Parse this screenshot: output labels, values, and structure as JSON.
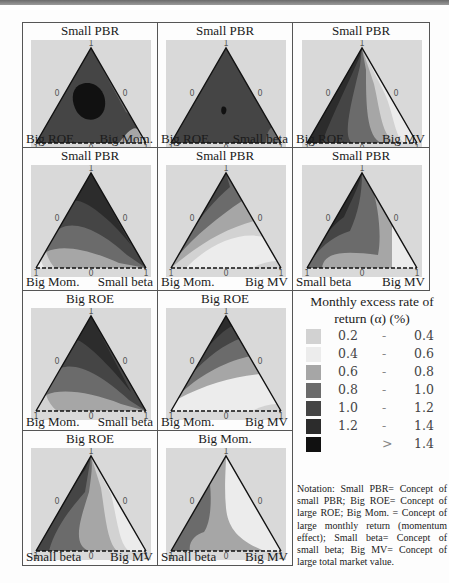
{
  "chart_data": {
    "type": "heatmap",
    "subtype": "ternary-contour",
    "title": "",
    "legend_title": "Monthly excess rate of return (α) (%)",
    "axis_tick_labels": {
      "vertex": "1",
      "edge_mid": "0",
      "corner": "1"
    },
    "bins": [
      {
        "range": "0.2 - 0.4",
        "color": "#d2d2d2"
      },
      {
        "range": "0.4 - 0.6",
        "color": "#ececec"
      },
      {
        "range": "0.6 - 0.8",
        "color": "#a6a6a6"
      },
      {
        "range": "0.8 - 1.0",
        "color": "#6b6b6b"
      },
      {
        "range": "1.0 - 1.2",
        "color": "#454545"
      },
      {
        "range": "1.2 - 1.4",
        "color": "#2c2c2c"
      },
      {
        "range": "> 1.4",
        "color": "#111111"
      }
    ],
    "panels": [
      {
        "top": "Small PBR",
        "bottom_left": "Big ROE",
        "bottom_right": "Big Mom.",
        "max_region": "1.2 - 1.4 (center)"
      },
      {
        "top": "Small PBR",
        "bottom_left": "Big ROE",
        "bottom_right": "Small beta",
        "max_region": "> 1.4 (small spot near center)"
      },
      {
        "top": "Small PBR",
        "bottom_left": "Big ROE",
        "bottom_right": "Big MV",
        "max_region": "1.2 - 1.4 (left edge)"
      },
      {
        "top": "Small PBR",
        "bottom_left": "Big Mom.",
        "bottom_right": "Small beta",
        "max_region": "1.2 - 1.4 (upper right)"
      },
      {
        "top": "Small PBR",
        "bottom_left": "Big Mom.",
        "bottom_right": "Big MV",
        "max_region": "1.0 - 1.2 (upper left edge)"
      },
      {
        "top": "Small PBR",
        "bottom_left": "Small beta",
        "bottom_right": "Big MV",
        "max_region": "1.2 - 1.4 (upper left)"
      },
      {
        "top": "Big ROE",
        "bottom_left": "Big Mom.",
        "bottom_right": "Small beta",
        "max_region": "1.2 - 1.4 (upper right)"
      },
      {
        "top": "Big ROE",
        "bottom_left": "Big Mom.",
        "bottom_right": "Big MV",
        "max_region": "1.2 - 1.4 (top vertex)"
      },
      {
        "top": "Big ROE",
        "bottom_left": "Small beta",
        "bottom_right": "Big MV",
        "max_region": "1.2 - 1.4 (left edge)"
      },
      {
        "top": "Big Mom.",
        "bottom_left": "Small beta",
        "bottom_right": "Big MV",
        "max_region": "0.8 - 1.0 (left edge)"
      }
    ]
  },
  "panels": [
    {
      "title": "Small PBR",
      "left": "Big ROE",
      "right": "Big Mom."
    },
    {
      "title": "Small PBR",
      "left": "Big ROE",
      "right": "Small beta"
    },
    {
      "title": "Small PBR",
      "left": "Big ROE",
      "right": "Big MV"
    },
    {
      "title": "Small PBR",
      "left": "Big Mom.",
      "right": "Small beta"
    },
    {
      "title": "Small PBR",
      "left": "Big Mom.",
      "right": "Big MV"
    },
    {
      "title": "Small PBR",
      "left": "Small beta",
      "right": "Big MV"
    },
    {
      "title": "Big ROE",
      "left": "Big Mom.",
      "right": "Small beta"
    },
    {
      "title": "Big ROE",
      "left": "Big Mom.",
      "right": "Big MV"
    },
    {
      "title": "Big ROE",
      "left": "Small beta",
      "right": "Big MV"
    },
    {
      "title": "Big Mom.",
      "left": "Small beta",
      "right": "Big MV"
    }
  ],
  "ticks": {
    "one": "1",
    "zero": "0"
  },
  "legend": {
    "title_line1": "Monthly excess rate of",
    "title_line2": "return (α) (%)",
    "rows": [
      {
        "a": "0.2",
        "dash": "-",
        "b": "0.4",
        "color": "#d2d2d2"
      },
      {
        "a": "0.4",
        "dash": "-",
        "b": "0.6",
        "color": "#ececec"
      },
      {
        "a": "0.6",
        "dash": "-",
        "b": "0.8",
        "color": "#a6a6a6"
      },
      {
        "a": "0.8",
        "dash": "-",
        "b": "1.0",
        "color": "#6b6b6b"
      },
      {
        "a": "1.0",
        "dash": "-",
        "b": "1.2",
        "color": "#454545"
      },
      {
        "a": "1.2",
        "dash": "-",
        "b": "1.4",
        "color": "#2c2c2c"
      },
      {
        "a": "",
        "dash": ">",
        "b": "1.4",
        "color": "#111111"
      }
    ]
  },
  "notation": "Notation: Small PBR= Concept of small PBR; Big ROE= Concept of large ROE; Big Mom. = Concept of large monthly return (momentum effect); Small beta= Concept of small beta; Big MV= Concept of large total market value."
}
